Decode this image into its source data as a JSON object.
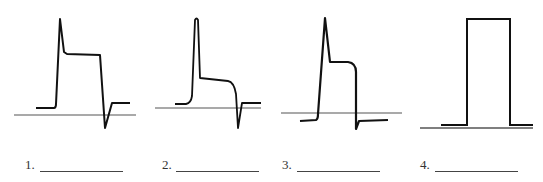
{
  "figure": {
    "items": [
      {
        "number": "1.",
        "answer_blank": "",
        "baseline": {
          "x1": 14,
          "x2": 136,
          "y": 115
        },
        "trace": "M36,108 L54,108 Q56,108 56,104 L60,19 L64,52 L67,54 L100,55 L105,128 L112,103 L130,103"
      },
      {
        "number": "2.",
        "answer_blank": "",
        "baseline": {
          "x1": 155,
          "x2": 261,
          "y": 108
        },
        "trace": "M175,104 L186,104 Q191,103 192,96 L195,20 Q196.5,17 198,20 L200,78 L228,81 Q234,82 236,94 L238,128 L242,103 L261,103"
      },
      {
        "number": "3.",
        "answer_blank": "",
        "baseline": {
          "x1": 281,
          "x2": 402,
          "y": 113
        },
        "trace": "M300,121 L316,120 Q318,119 318,114 L325,18 L330,62 L348,62 Q356,63 356,72 L356,129 L359,121 L388,120"
      },
      {
        "number": "4.",
        "answer_blank": "",
        "baseline": {
          "x1": 420,
          "x2": 533,
          "y": 128
        },
        "trace": "M441,125 L467,125 L467,19 L510,19 L510,125 L533,125"
      }
    ],
    "colors": {
      "trace": "#111111",
      "baseline": "#555555",
      "text": "#333333"
    }
  }
}
